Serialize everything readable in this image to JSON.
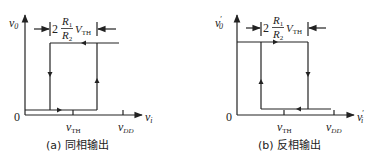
{
  "figures": [
    {
      "id": "a",
      "caption": "(a) 同相输出",
      "y_label": "v",
      "y_label_sub": "0",
      "x_label": "v",
      "x_label_sub": "i",
      "origin": "0",
      "tick_vth": "v",
      "tick_vth_sub": "TH",
      "tick_vdd": "v",
      "tick_vdd_sub": "DD",
      "width_annotation": {
        "coef": "2",
        "num": "R",
        "num_sub": "1",
        "den": "R",
        "den_sub": "2",
        "v": "V",
        "v_sub": "TH"
      }
    },
    {
      "id": "b",
      "caption": "(b) 反相输出",
      "y_label": "v",
      "y_label_sub": "0",
      "y_label_prime": "′",
      "x_label": "v",
      "x_label_sub": "i",
      "x_label_prime": "′",
      "origin": "0",
      "tick_vth": "v",
      "tick_vth_sub": "TH",
      "tick_vdd": "v",
      "tick_vdd_sub": "DD",
      "width_annotation": {
        "coef": "2",
        "num": "R",
        "num_sub": "1",
        "den": "R",
        "den_sub": "2",
        "v": "V",
        "v_sub": "TH"
      }
    }
  ],
  "colors": {
    "line": "#222222",
    "text": "#222222",
    "background": "#ffffff"
  }
}
